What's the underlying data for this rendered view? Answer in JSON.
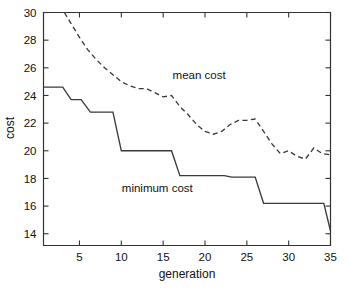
{
  "chart_data": {
    "type": "line",
    "title": "",
    "xlabel": "generation",
    "ylabel": "cost",
    "xlim": [
      0.7,
      35
    ],
    "ylim": [
      13.15,
      30
    ],
    "grid": false,
    "legend_position": "inline-annotation",
    "xticks": [
      5,
      10,
      15,
      20,
      25,
      30,
      35
    ],
    "xtick_labels": [
      "5",
      "10",
      "15",
      "20",
      "25",
      "30",
      "35"
    ],
    "yticks": [
      14,
      16,
      18,
      20,
      22,
      24,
      26,
      28,
      30
    ],
    "ytick_labels": [
      "14",
      "16",
      "18",
      "20",
      "22",
      "24",
      "26",
      "28",
      "30"
    ],
    "annotations": [
      {
        "text": "mean cost",
        "x": 19.3,
        "y": 25.2
      },
      {
        "text": "minimum cost",
        "x": 14.3,
        "y": 17.0
      }
    ],
    "series": [
      {
        "name": "mean cost",
        "style": "dashed",
        "x": [
          3.2,
          4,
          5,
          6,
          7,
          8,
          9,
          10,
          11,
          12,
          13,
          14,
          15,
          16,
          17,
          18,
          19,
          20,
          21,
          22,
          23,
          24,
          25,
          26,
          27,
          28,
          29,
          30,
          31,
          32,
          33,
          34,
          35
        ],
        "values": [
          30.0,
          29.2,
          28.2,
          27.3,
          26.6,
          26.0,
          25.5,
          25.0,
          24.7,
          24.5,
          24.5,
          24.2,
          23.9,
          24.0,
          23.2,
          22.6,
          21.9,
          21.4,
          21.2,
          21.4,
          21.9,
          22.2,
          22.2,
          22.3,
          21.4,
          20.5,
          19.8,
          20.0,
          19.6,
          19.4,
          20.2,
          19.8,
          19.7
        ]
      },
      {
        "name": "minimum cost",
        "style": "solid",
        "x": [
          0.7,
          3.0,
          4.0,
          5.2,
          6.3,
          9.0,
          10.0,
          16.0,
          17.0,
          22.3,
          23.2,
          26.0,
          27.0,
          34.2,
          35.0
        ],
        "values": [
          24.6,
          24.6,
          23.7,
          23.7,
          22.8,
          22.8,
          20.0,
          20.0,
          18.2,
          18.2,
          18.1,
          18.1,
          16.2,
          16.2,
          14.2
        ]
      }
    ]
  }
}
